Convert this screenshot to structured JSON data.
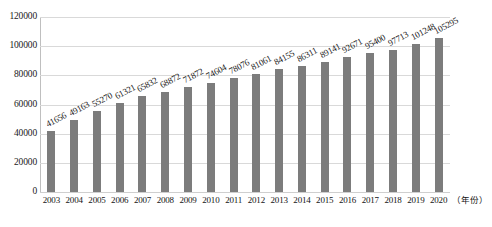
{
  "chart_data": {
    "type": "bar",
    "title": "",
    "subtitle": "",
    "xlabel": "（年份）",
    "ylabel": "",
    "categories": [
      "2003",
      "2004",
      "2005",
      "2006",
      "2007",
      "2008",
      "2009",
      "2010",
      "2011",
      "2012",
      "2013",
      "2014",
      "2015",
      "2016",
      "2017",
      "2018",
      "2019",
      "2020"
    ],
    "values": [
      41656,
      49163,
      55270,
      61321,
      65832,
      68872,
      71872,
      74604,
      78076,
      81061,
      84155,
      86311,
      89141,
      92671,
      95400,
      97713,
      101248,
      105295
    ],
    "series": [
      {
        "name": "",
        "values": [
          41656,
          49163,
          55270,
          61321,
          65832,
          68872,
          71872,
          74604,
          78076,
          81061,
          84155,
          86311,
          89141,
          92671,
          95400,
          97713,
          101248,
          105295
        ]
      }
    ],
    "ylim": [
      0,
      120000
    ],
    "y_ticks": [
      0,
      20000,
      40000,
      60000,
      80000,
      100000,
      120000
    ],
    "y_tick_labels": [
      "0",
      "20000",
      "40000",
      "60000",
      "80000",
      "100000",
      "120000"
    ],
    "grid": true,
    "grid_axis": "y",
    "legend": false,
    "legend_position": "none",
    "data_labels": true,
    "data_label_rotation": -28,
    "bar_color": "#7c7c7c",
    "gridline_color": "#d9d9d9",
    "axis_color": "#bfbfbf",
    "text_color": "#141414",
    "background_color": "#ffffff",
    "annotations": []
  }
}
